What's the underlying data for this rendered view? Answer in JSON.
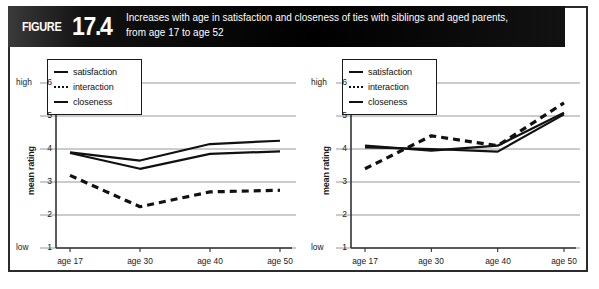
{
  "figure": {
    "badge_word": "FIGURE",
    "badge_number": "17.4",
    "title_line1": "Increases with age in satisfaction and closeness of ties with siblings and aged parents,",
    "title_line2": "from age 17 to age 52",
    "header_color": "#000000",
    "border_color": "#2b2b2b",
    "ink_color": "#111111",
    "gridline_color": "#8c8c8c"
  },
  "bottom_caption": "",
  "legend": {
    "items": [
      {
        "label": "satisfaction",
        "style": "solid"
      },
      {
        "label": "interaction",
        "style": "dotted"
      },
      {
        "label": "closeness",
        "style": "solid"
      }
    ]
  },
  "axis": {
    "ylabel": "mean rating",
    "high_label": "high",
    "low_label": "low",
    "yticks": [
      "6",
      "5",
      "4",
      "3",
      "2",
      "1"
    ],
    "xticks": [
      "age 17",
      "age 30",
      "age 40",
      "age 50"
    ]
  },
  "chart_data": [
    {
      "type": "line",
      "title": "Siblings",
      "xlabel": "",
      "ylabel": "mean rating",
      "categories": [
        "age 17",
        "age 30",
        "age 40",
        "age 50"
      ],
      "ylim": [
        1,
        6
      ],
      "yticks": [
        1,
        2,
        3,
        4,
        5,
        6
      ],
      "grid": true,
      "legend_position": "top-left",
      "series": [
        {
          "name": "satisfaction",
          "style": "solid",
          "values": [
            3.9,
            3.65,
            4.15,
            4.25
          ]
        },
        {
          "name": "interaction",
          "style": "dashed",
          "values": [
            3.2,
            2.25,
            2.7,
            2.75
          ]
        },
        {
          "name": "closeness",
          "style": "solid",
          "values": [
            3.88,
            3.4,
            3.85,
            3.93
          ]
        }
      ]
    },
    {
      "type": "line",
      "title": "Aged parents",
      "xlabel": "",
      "ylabel": "mean rating",
      "categories": [
        "age 17",
        "age 30",
        "age 40",
        "age 50"
      ],
      "ylim": [
        1,
        6
      ],
      "yticks": [
        1,
        2,
        3,
        4,
        5,
        6
      ],
      "grid": true,
      "legend_position": "top-left",
      "series": [
        {
          "name": "satisfaction",
          "style": "solid",
          "values": [
            4.1,
            3.95,
            4.1,
            5.1
          ]
        },
        {
          "name": "interaction",
          "style": "dashed",
          "values": [
            3.4,
            4.4,
            4.1,
            5.4
          ]
        },
        {
          "name": "closeness",
          "style": "solid",
          "values": [
            4.05,
            4.0,
            3.92,
            5.05
          ]
        }
      ]
    }
  ]
}
